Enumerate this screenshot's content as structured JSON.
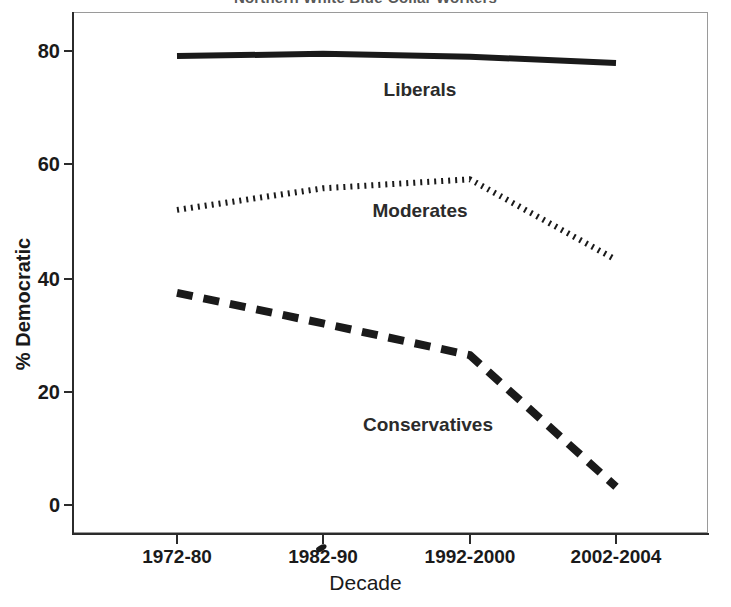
{
  "chart_data": {
    "type": "line",
    "title": "Northern White Blue-Collar Workers",
    "xlabel": "Decade",
    "ylabel": "% Democratic",
    "categories": [
      "1972-80",
      "1982-90",
      "1992-2000",
      "2002-2004"
    ],
    "ylim": [
      0,
      88
    ],
    "yticks": [
      0,
      20,
      40,
      60,
      80
    ],
    "ytick_labels": [
      "0",
      "20",
      "40",
      "60",
      "80"
    ],
    "grid": false,
    "legend": "inline-labels",
    "series": [
      {
        "name": "Liberals",
        "style": "solid",
        "color": "#1a1a1a",
        "values": [
          79.1,
          79.5,
          79.0,
          77.9
        ]
      },
      {
        "name": "Moderates",
        "style": "dotted",
        "color": "#1a1a1a",
        "values": [
          52.0,
          55.8,
          57.4,
          43.2
        ]
      },
      {
        "name": "Conservatives",
        "style": "dashed",
        "color": "#1a1a1a",
        "values": [
          37.4,
          32.0,
          26.4,
          3.2
        ]
      }
    ],
    "annotations": [
      {
        "text": "Liberals",
        "x_px": 420,
        "y_px": 90
      },
      {
        "text": "Moderates",
        "x_px": 420,
        "y_px": 211
      },
      {
        "text": "Conservatives",
        "x_px": 428,
        "y_px": 425
      }
    ]
  },
  "axes": {
    "y": {
      "title": "% Democratic",
      "ticks": [
        {
          "label": "80",
          "y_px": 51
        },
        {
          "label": "60",
          "y_px": 164
        },
        {
          "label": "40",
          "y_px": 279
        },
        {
          "label": "20",
          "y_px": 392
        },
        {
          "label": "0",
          "y_px": 505
        }
      ]
    },
    "x": {
      "title": "Decade",
      "ticks": [
        {
          "label": "1972-80",
          "x_px": 177
        },
        {
          "label": "1982-90",
          "x_px": 323
        },
        {
          "label": "1992-2000",
          "x_px": 470
        },
        {
          "label": "2002-2004",
          "x_px": 616
        }
      ]
    }
  }
}
